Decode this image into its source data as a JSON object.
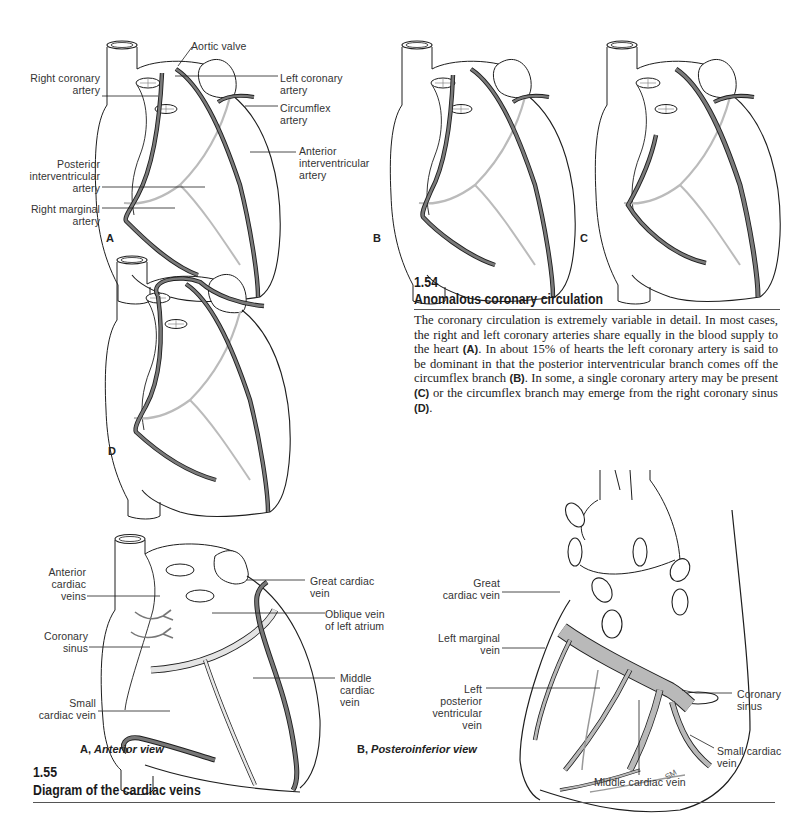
{
  "figure_1_54": {
    "number": "1.54",
    "title": "Anomalous coronary circulation",
    "caption_parts": [
      "The coronary circulation is extremely variable in detail. In most cases, the right and left coronary arteries share equally in the blood supply to the heart ",
      "(A)",
      ". In about 15% of hearts the left coronary artery is said to be dominant in that the posterior interventricular branch comes off the circumflex branch ",
      "(B)",
      ". In some, a single coronary artery may be present ",
      "(C)",
      " or the circumflex branch may emerge from the right coronary sinus ",
      "(D)",
      "."
    ],
    "panels": {
      "A": "A",
      "B": "B",
      "C": "C",
      "D": "D"
    },
    "labels_A": {
      "aortic_valve": "Aortic valve",
      "right_coronary_artery": "Right coronary\nartery",
      "left_coronary_artery": "Left coronary\nartery",
      "circumflex_artery": "Circumflex\nartery",
      "anterior_interventricular_artery": "Anterior\ninterventricular\nartery",
      "posterior_interventricular_artery": "Posterior\ninterventricular\nartery",
      "right_marginal_artery": "Right marginal\nartery"
    }
  },
  "figure_1_55": {
    "number": "1.55",
    "title": "Diagram of the cardiac veins",
    "view_A": {
      "letter": "A,",
      "name": "Anterior view"
    },
    "view_B": {
      "letter": "B,",
      "name": "Posteroinferior view"
    },
    "labels_A": {
      "anterior_cardiac_veins": "Anterior\ncardiac\nveins",
      "coronary_sinus": "Coronary\nsinus",
      "small_cardiac_vein": "Small\ncardiac vein",
      "great_cardiac_vein": "Great cardiac\nvein",
      "oblique_vein_left_atrium": "Oblique vein\nof left atrium",
      "middle_cardiac_vein": "Middle\ncardiac\nvein"
    },
    "labels_B": {
      "great_cardiac_vein": "Great\ncardiac vein",
      "left_marginal_vein": "Left marginal\nvein",
      "left_posterior_ventricular_vein": "Left\nposterior\nventricular\nvein",
      "coronary_sinus": "Coronary\nsinus",
      "small_cardiac_vein": "Small cardiac\nvein",
      "middle_cardiac_vein": "Middle cardiac vein",
      "artist_initials": "SM"
    }
  },
  "colors": {
    "artery": "#6f6f6f",
    "vein_fill": "#b9b9b9",
    "line": "#1e1e1e",
    "rule": "#555555"
  }
}
